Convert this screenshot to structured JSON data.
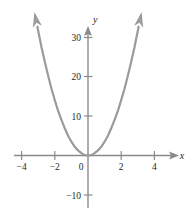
{
  "figure": {
    "title": "",
    "background_color": "#ffffff",
    "curve_color": "#9b9b9b",
    "axis_color": "#8a8a8a",
    "text_color": "#231f20"
  },
  "chart_data": {
    "type": "line",
    "title": "",
    "subtitle": "",
    "xlabel": "x",
    "ylabel": "y",
    "function": "y = 3.5x^2",
    "grid": false,
    "legend": null,
    "xlim": [
      -4.6,
      5.0
    ],
    "ylim": [
      -13,
      33
    ],
    "xticks": [
      -4,
      -2,
      0,
      2,
      4
    ],
    "xtick_labels": [
      "−4",
      "−2",
      "0",
      "2",
      "4"
    ],
    "yticks": [
      -10,
      10,
      20,
      30
    ],
    "ytick_labels": [
      "−10",
      "10",
      "20",
      "30"
    ],
    "origin_label": "0",
    "series": [
      {
        "name": "parabola",
        "color": "#9b9b9b",
        "arrow_start": true,
        "arrow_end": true,
        "x": [
          -3.05,
          -2.8,
          -2.6,
          -2.4,
          -2.2,
          -2.0,
          -1.8,
          -1.6,
          -1.4,
          -1.2,
          -1.0,
          -0.8,
          -0.6,
          -0.4,
          -0.2,
          0,
          0.2,
          0.4,
          0.6,
          0.8,
          1.0,
          1.2,
          1.4,
          1.6,
          1.8,
          2.0,
          2.2,
          2.4,
          2.6,
          2.8,
          3.05
        ],
        "y": [
          32.6,
          27.4,
          23.7,
          20.2,
          16.9,
          14.0,
          11.3,
          9.0,
          6.9,
          5.0,
          3.5,
          2.2,
          1.3,
          0.6,
          0.1,
          0,
          0.1,
          0.6,
          1.3,
          2.2,
          3.5,
          5.0,
          6.9,
          9.0,
          11.3,
          14.0,
          16.9,
          20.2,
          23.7,
          27.4,
          32.6
        ]
      }
    ]
  }
}
